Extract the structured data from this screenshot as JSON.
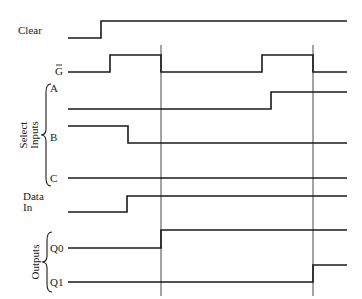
{
  "diagram": {
    "type": "timing-diagram",
    "colors": {
      "line": "#1a1a1a",
      "background": "#ffffff"
    },
    "signals": [
      {
        "id": "clear",
        "label": "Clear",
        "label_pos": [
          18,
          34
        ],
        "points": [
          [
            68,
            38
          ],
          [
            101,
            38
          ],
          [
            101,
            21
          ],
          [
            347,
            21
          ]
        ]
      },
      {
        "id": "g-bar",
        "label": "G",
        "overbar": true,
        "label_pos": [
          55,
          75
        ],
        "points": [
          [
            68,
            72
          ],
          [
            110,
            72
          ],
          [
            110,
            55
          ],
          [
            161,
            55
          ],
          [
            161,
            72
          ],
          [
            262,
            72
          ],
          [
            262,
            55
          ],
          [
            313,
            55
          ],
          [
            313,
            72
          ],
          [
            347,
            72
          ]
        ]
      },
      {
        "id": "select-a",
        "label": "A",
        "label_pos": [
          50,
          92
        ],
        "points": [
          [
            68,
            109
          ],
          [
            271,
            109
          ],
          [
            271,
            92
          ],
          [
            347,
            92
          ]
        ]
      },
      {
        "id": "select-b",
        "label": "B",
        "label_pos": [
          50,
          141
        ],
        "points": [
          [
            68,
            126
          ],
          [
            128,
            126
          ],
          [
            128,
            143
          ],
          [
            347,
            143
          ]
        ]
      },
      {
        "id": "select-c",
        "label": "C",
        "label_pos": [
          50,
          182
        ],
        "points": [
          [
            68,
            178
          ],
          [
            347,
            178
          ]
        ]
      },
      {
        "id": "data-in",
        "label_lines": [
          "Data",
          "In"
        ],
        "label_pos": [
          23,
          200
        ],
        "points": [
          [
            68,
            212
          ],
          [
            127,
            212
          ],
          [
            127,
            196
          ],
          [
            347,
            196
          ]
        ]
      },
      {
        "id": "q0",
        "label": "Q0",
        "label_pos": [
          50,
          252
        ],
        "points": [
          [
            68,
            248
          ],
          [
            161,
            248
          ],
          [
            161,
            230
          ],
          [
            347,
            230
          ]
        ]
      },
      {
        "id": "q1",
        "label": "Q1",
        "label_pos": [
          50,
          286
        ],
        "points": [
          [
            68,
            282
          ],
          [
            313,
            282
          ],
          [
            313,
            265
          ],
          [
            347,
            265
          ]
        ]
      }
    ],
    "markers": [
      {
        "x": 161,
        "y1": 45,
        "y2": 296
      },
      {
        "x": 313,
        "y1": 45,
        "y2": 296
      }
    ],
    "groups": [
      {
        "id": "select-inputs",
        "label_lines": [
          "Select",
          "Inputs"
        ],
        "brace": {
          "x": 46,
          "y1": 84,
          "y2": 186
        }
      },
      {
        "id": "outputs",
        "label_lines": [
          "Outputs"
        ],
        "brace": {
          "x": 47,
          "y1": 232,
          "y2": 292
        }
      }
    ]
  }
}
